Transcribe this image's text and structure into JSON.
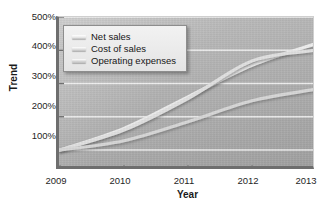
{
  "chart_data": {
    "type": "line",
    "title": "",
    "xlabel": "Year",
    "ylabel": "Trend",
    "x": [
      2009,
      2010,
      2011,
      2012,
      2013
    ],
    "xtick_labels": [
      "2009",
      "2010",
      "2011",
      "2012",
      "2013"
    ],
    "ytick_labels": [
      "100%",
      "200%",
      "300%",
      "400%",
      "500%"
    ],
    "ytick_values": [
      100,
      200,
      300,
      400,
      500
    ],
    "ylim": [
      40,
      500
    ],
    "xlim": [
      2009,
      2013
    ],
    "grid": true,
    "legend_position": "upper-left",
    "series": [
      {
        "name": "Net sales",
        "values": [
          100,
          165,
          260,
          355,
          420
        ]
      },
      {
        "name": "Cost of sales",
        "values": [
          100,
          160,
          255,
          368,
          400
        ]
      },
      {
        "name": "Operating expenses",
        "values": [
          100,
          128,
          185,
          248,
          283
        ]
      }
    ]
  },
  "axes": {
    "y_title": "Trend",
    "x_title": "Year",
    "y_ticks": [
      "500%",
      "400%",
      "300%",
      "200%",
      "100%"
    ],
    "x_ticks": [
      "2009",
      "2010",
      "2011",
      "2012",
      "2013"
    ]
  },
  "legend": {
    "items": [
      {
        "label": "Net sales",
        "swatch_color": "#e8e8e8"
      },
      {
        "label": "Cost of sales",
        "swatch_color": "#dedede"
      },
      {
        "label": "Operating expenses",
        "swatch_color": "#d4d4d4"
      }
    ]
  },
  "colors": {
    "plot_background": "#b2b2b2",
    "gridline": "#f0f0f0",
    "axis": "#6e6e6e",
    "page_background": "#ffffff",
    "text": "#1a1a1a",
    "series_1": "#ededed",
    "series_2": "#e0e0e0",
    "series_3": "#d6d6d6"
  }
}
